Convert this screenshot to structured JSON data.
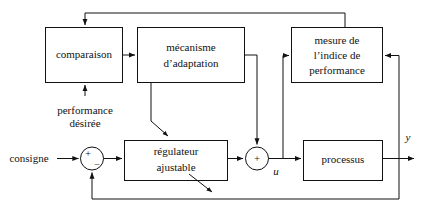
{
  "diagram": {
    "type": "block-diagram",
    "background_color": "#ffffff",
    "line_color": "#111111",
    "text_color": "#111111",
    "blocks": {
      "comparaison": {
        "label": "comparaison"
      },
      "mecanisme": {
        "line1": "mécanisme",
        "line2": "d’adaptation"
      },
      "mesure": {
        "line1": "mesure de",
        "line2": "l’indice de",
        "line3": "performance"
      },
      "regulateur": {
        "line1": "régulateur",
        "line2": "ajustable"
      },
      "processus": {
        "label": "processus"
      }
    },
    "labels": {
      "performance_line1": "performance",
      "performance_line2": "désirée",
      "consigne": "consigne",
      "signal_u": "u",
      "signal_y": "y",
      "sum_plus_left": "+",
      "sum_minus_left": "−",
      "sum_plus_mid": "+"
    }
  }
}
